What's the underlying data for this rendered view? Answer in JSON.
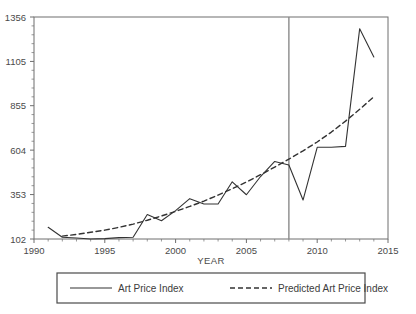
{
  "chart_data": {
    "type": "line",
    "title": "",
    "xlabel": "YEAR",
    "ylabel": "",
    "xlim": [
      1990,
      2015
    ],
    "ylim": [
      102,
      1356
    ],
    "grid": false,
    "legend_position": "bottom",
    "xticks": [
      1990,
      1995,
      2000,
      2005,
      2010,
      2015
    ],
    "xtick_labels": [
      "1990",
      "1995",
      "2000",
      "2005",
      "2010",
      "2015"
    ],
    "minor_xtick_step": 1,
    "yticks": [
      102,
      353,
      604,
      855,
      1105,
      1356
    ],
    "ytick_labels": [
      "102",
      "353",
      "604",
      "855",
      "1105",
      "1356"
    ],
    "annotations": [
      {
        "type": "vertical-line",
        "x": 2008,
        "label": "",
        "color": "#8a8a8a"
      }
    ],
    "series": [
      {
        "name": "Art Price Index",
        "style": "solid",
        "color": "#333333",
        "x": [
          1991,
          1992,
          1993,
          1994,
          1995,
          1996,
          1997,
          1998,
          1999,
          2000,
          2001,
          2002,
          2003,
          2004,
          2005,
          2006,
          2007,
          2008,
          2009,
          2010,
          2011,
          2012,
          2013,
          2014
        ],
        "values": [
          168,
          112,
          108,
          102,
          104,
          110,
          112,
          240,
          205,
          262,
          330,
          300,
          300,
          425,
          352,
          455,
          540,
          520,
          322,
          620,
          620,
          625,
          1290,
          1130
        ]
      },
      {
        "name": "Predicted Art Price Index",
        "style": "dashed",
        "color": "#333333",
        "x": [
          1992,
          1993,
          1994,
          1995,
          1996,
          1997,
          1998,
          1999,
          2000,
          2001,
          2002,
          2003,
          2004,
          2005,
          2006,
          2007,
          2008,
          2009,
          2010,
          2011,
          2012,
          2013,
          2014
        ],
        "values": [
          118,
          128,
          140,
          152,
          168,
          186,
          208,
          232,
          258,
          286,
          316,
          350,
          386,
          424,
          465,
          508,
          553,
          600,
          650,
          706,
          768,
          835,
          905
        ]
      }
    ]
  },
  "legend": {
    "items": [
      {
        "label": "Art Price Index",
        "style": "solid"
      },
      {
        "label": "Predicted Art Price Index",
        "style": "dashed"
      }
    ]
  },
  "axis": {
    "x_title": "YEAR"
  },
  "colors": {
    "line": "#333333",
    "axis": "#6e6e6e",
    "text": "#4a4a4a",
    "vline": "#8a8a8a",
    "legend_border": "#4a4a4a"
  }
}
